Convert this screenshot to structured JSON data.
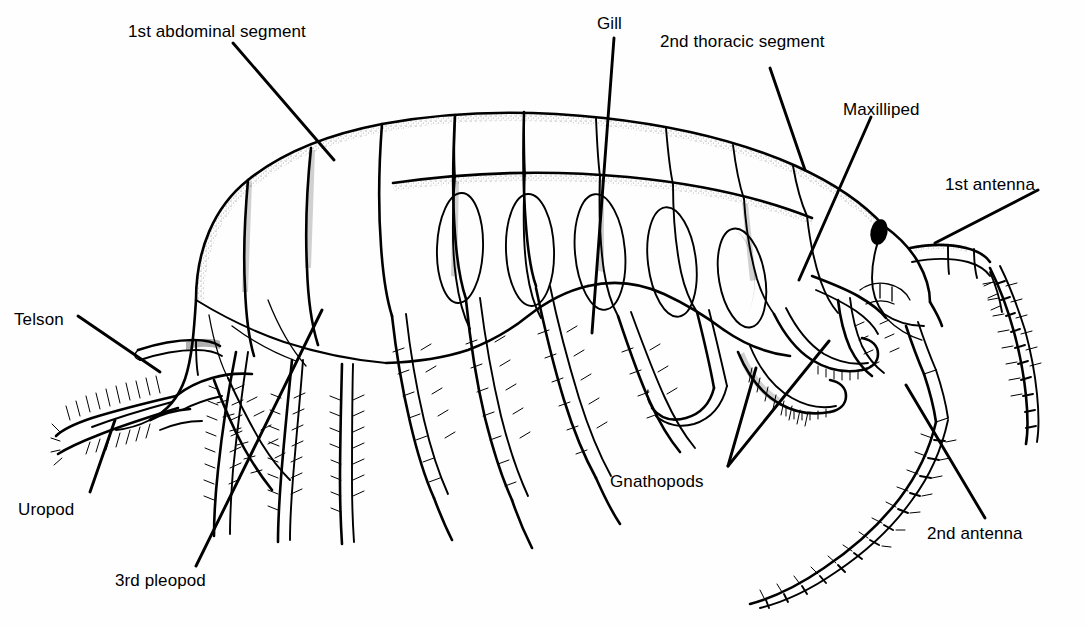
{
  "figure": {
    "organism": "amphipod",
    "view": "lateral",
    "style": "black-and-white stippled line drawing",
    "background_color": "#fefefe",
    "ink_color": "#000000"
  },
  "labels": [
    {
      "id": "first-abdominal-segment",
      "text": "1st abdominal segment",
      "x": 128,
      "y": 22,
      "anchor": "start"
    },
    {
      "id": "gill",
      "text": "Gill",
      "x": 597,
      "y": 14,
      "anchor": "start"
    },
    {
      "id": "second-thoracic-segment",
      "text": "2nd thoracic segment",
      "x": 660,
      "y": 32,
      "anchor": "start"
    },
    {
      "id": "maxilliped",
      "text": "Maxilliped",
      "x": 843,
      "y": 100,
      "anchor": "start"
    },
    {
      "id": "first-antenna",
      "text": "1st antenna",
      "x": 945,
      "y": 175,
      "anchor": "start"
    },
    {
      "id": "telson",
      "text": "Telson",
      "x": 14,
      "y": 310,
      "anchor": "start"
    },
    {
      "id": "uropod",
      "text": "Uropod",
      "x": 18,
      "y": 500,
      "anchor": "start"
    },
    {
      "id": "third-pleopod",
      "text": "3rd pleopod",
      "x": 115,
      "y": 571,
      "anchor": "start"
    },
    {
      "id": "gnathopods",
      "text": "Gnathopods",
      "x": 610,
      "y": 472,
      "anchor": "start"
    },
    {
      "id": "second-antenna",
      "text": "2nd antenna",
      "x": 927,
      "y": 524,
      "anchor": "start"
    }
  ],
  "leaders": [
    {
      "id": "leader-first-abdominal-segment",
      "points": "233,43 334,160"
    },
    {
      "id": "leader-gill",
      "points": "614,38 592,333"
    },
    {
      "id": "leader-second-thoracic-segment",
      "points": "770,68 805,170"
    },
    {
      "id": "leader-maxilliped",
      "points": "871,117 799,280"
    },
    {
      "id": "leader-first-antenna",
      "points": "1038,190 935,243"
    },
    {
      "id": "leader-telson",
      "points": "78,316 160,372"
    },
    {
      "id": "leader-uropod",
      "points": "90,492 115,420"
    },
    {
      "id": "leader-third-pleopod",
      "points": "196,566 322,310"
    },
    {
      "id": "leader-gnathopods-upper",
      "points": "728,466 756,368"
    },
    {
      "id": "leader-gnathopods-lower",
      "points": "728,466 829,341"
    },
    {
      "id": "leader-second-antenna",
      "points": "985,518 906,385"
    }
  ],
  "anatomy_parts": [
    "1st abdominal segment",
    "Gill",
    "2nd thoracic segment",
    "Maxilliped",
    "1st antenna",
    "Telson",
    "Uropod",
    "3rd pleopod",
    "Gnathopods",
    "2nd antenna"
  ]
}
